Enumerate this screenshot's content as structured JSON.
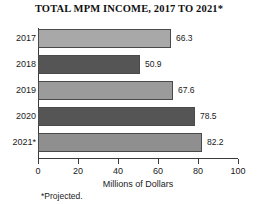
{
  "chart_data": {
    "type": "bar",
    "orientation": "horizontal",
    "title": "TOTAL MPM INCOME, 2017 TO 2021*",
    "categories": [
      "2017",
      "2018",
      "2019",
      "2020",
      "2021*"
    ],
    "values": [
      66.3,
      50.9,
      67.6,
      78.5,
      82.2
    ],
    "value_labels": [
      "66.3",
      "50.9",
      "67.6",
      "78.5",
      "82.2"
    ],
    "bar_colors": [
      "#a8a8a8",
      "#555555",
      "#9b9b9b",
      "#555555",
      "#8f8f8f"
    ],
    "bar_border_color": "#4a4a4a",
    "xlabel": "Millions of Dollars",
    "ylabel": "",
    "xlim": [
      0,
      100
    ],
    "xticks": [
      0,
      20,
      40,
      60,
      80,
      100
    ],
    "xtick_labels": [
      "0",
      "20",
      "40",
      "60",
      "80",
      "100"
    ],
    "grid": false,
    "legend": false,
    "footnote": "*Projected."
  }
}
